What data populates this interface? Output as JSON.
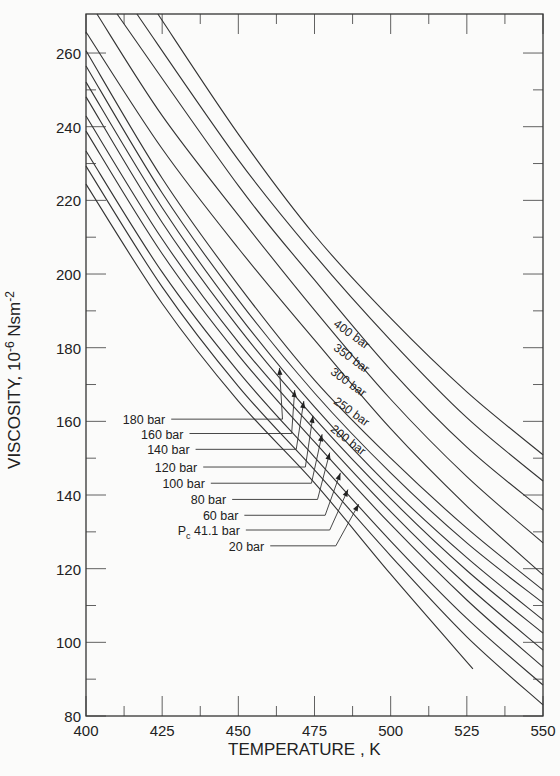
{
  "page": {
    "top_text_fragment": "—   —  ·  ·  ·    ·  ·  ·  ·  ·"
  },
  "chart_data": {
    "type": "line",
    "title": "",
    "xlabel": "TEMPERATURE , K",
    "ylabel_main": "VISCOSITY, 10",
    "ylabel_exp": "-6",
    "ylabel_unit": " Nsm",
    "ylabel_unit_exp": "-2",
    "xlim": [
      400,
      550
    ],
    "ylim": [
      80,
      270.6
    ],
    "grid": false,
    "x_ticks": [
      400,
      425,
      450,
      475,
      500,
      525,
      550
    ],
    "x_tick_labels": [
      "400",
      "425",
      "450",
      "475",
      "500",
      "525",
      "550"
    ],
    "x_minor_ticks": [
      412.5,
      437.5,
      462.5,
      487.5,
      512.5,
      537.5
    ],
    "y_ticks": [
      80,
      100,
      120,
      140,
      160,
      180,
      200,
      220,
      240,
      260
    ],
    "y_tick_labels": [
      "80",
      "100",
      "120",
      "140",
      "160",
      "180",
      "200",
      "220",
      "240",
      "260"
    ],
    "y_minor_ticks": [
      90,
      110,
      130,
      150,
      170,
      190,
      210,
      230,
      250
    ],
    "series": [
      {
        "name": "400 bar",
        "points": [
          [
            423.6,
            270.6
          ],
          [
            450,
            238
          ],
          [
            475,
            210.6
          ],
          [
            500,
            188
          ],
          [
            525,
            168
          ],
          [
            550,
            150.9
          ]
        ]
      },
      {
        "name": "350 bar",
        "points": [
          [
            416.7,
            270.6
          ],
          [
            450,
            231
          ],
          [
            475,
            205.2
          ],
          [
            500,
            182
          ],
          [
            525,
            161
          ],
          [
            550,
            143.8
          ]
        ]
      },
      {
        "name": "300 bar",
        "points": [
          [
            410.2,
            270.6
          ],
          [
            450,
            224
          ],
          [
            475,
            198.4
          ],
          [
            500,
            174
          ],
          [
            525,
            153
          ],
          [
            550,
            135.9
          ]
        ]
      },
      {
        "name": "250 bar",
        "points": [
          [
            403.6,
            270.6
          ],
          [
            425,
            243
          ],
          [
            450,
            216
          ],
          [
            475,
            190.2
          ],
          [
            500,
            166
          ],
          [
            525,
            145
          ],
          [
            550,
            127.0
          ]
        ]
      },
      {
        "name": "200 bar",
        "points": [
          [
            400,
            265.7
          ],
          [
            425,
            234
          ],
          [
            450,
            207
          ],
          [
            475,
            182.1
          ],
          [
            500,
            158
          ],
          [
            525,
            137
          ],
          [
            550,
            118.3
          ]
        ]
      },
      {
        "name": "180 bar",
        "points": [
          [
            400,
            260.6
          ],
          [
            425,
            226
          ],
          [
            450,
            197
          ],
          [
            475,
            171.2
          ],
          [
            500,
            150
          ],
          [
            525,
            131
          ],
          [
            550,
            114.2
          ]
        ]
      },
      {
        "name": "160 bar",
        "points": [
          [
            400,
            256.5
          ],
          [
            425,
            222
          ],
          [
            450,
            193
          ],
          [
            475,
            167.7
          ],
          [
            500,
            146
          ],
          [
            525,
            127
          ],
          [
            550,
            110.7
          ]
        ]
      },
      {
        "name": "140 bar",
        "points": [
          [
            400,
            252.1
          ],
          [
            425,
            218
          ],
          [
            450,
            189
          ],
          [
            475,
            163.9
          ],
          [
            500,
            142
          ],
          [
            525,
            123
          ],
          [
            550,
            106.1
          ]
        ]
      },
      {
        "name": "120 bar",
        "points": [
          [
            400,
            248.1
          ],
          [
            425,
            214
          ],
          [
            450,
            185.5
          ],
          [
            475,
            160.9
          ],
          [
            500,
            139
          ],
          [
            525,
            119.5
          ],
          [
            550,
            102.5
          ]
        ]
      },
      {
        "name": "100 bar",
        "points": [
          [
            400,
            242.9
          ],
          [
            425,
            209.5
          ],
          [
            450,
            181.5
          ],
          [
            475,
            157.7
          ],
          [
            500,
            135.5
          ],
          [
            525,
            115.5
          ],
          [
            550,
            97.9
          ]
        ]
      },
      {
        "name": "80 bar",
        "points": [
          [
            400,
            238.8
          ],
          [
            425,
            205.5
          ],
          [
            450,
            178
          ],
          [
            475,
            154.4
          ],
          [
            500,
            132
          ],
          [
            525,
            111.5
          ],
          [
            550,
            93.3
          ]
        ]
      },
      {
        "name": "60 bar",
        "points": [
          [
            400,
            233.4
          ],
          [
            425,
            200.5
          ],
          [
            450,
            173.5
          ],
          [
            475,
            150.3
          ],
          [
            500,
            127.5
          ],
          [
            525,
            106.5
          ],
          [
            550,
            88.4
          ]
        ]
      },
      {
        "name": "Pc 41.1 bar",
        "points": [
          [
            400,
            229.3
          ],
          [
            425,
            196.5
          ],
          [
            450,
            169.5
          ],
          [
            475,
            146.8
          ],
          [
            500,
            123.5
          ],
          [
            525,
            101.5
          ],
          [
            550,
            83.0
          ]
        ]
      },
      {
        "name": "20 bar",
        "points": [
          [
            400,
            224.4
          ],
          [
            425,
            192
          ],
          [
            450,
            165.5
          ],
          [
            475,
            143.3
          ],
          [
            500,
            118.5
          ],
          [
            527,
            92.8
          ]
        ]
      }
    ],
    "annotations_right": [
      {
        "text": "400 bar",
        "x": 481,
        "y": 186,
        "angle": 36
      },
      {
        "text": "350 bar",
        "x": 481,
        "y": 179.5,
        "angle": 36
      },
      {
        "text": "300 bar",
        "x": 480,
        "y": 173,
        "angle": 36
      },
      {
        "text": "250 bar",
        "x": 481,
        "y": 165,
        "angle": 36
      },
      {
        "text": "200 bar",
        "x": 480,
        "y": 157.5,
        "angle": 38
      }
    ],
    "annotations_left": [
      {
        "text": "180 bar",
        "lx": 464.5,
        "ly": 160.6,
        "ax": 463.5,
        "ay": 174.5,
        "tx": 426,
        "ty": 160.6
      },
      {
        "text": "160 bar",
        "lx": 467.5,
        "ly": 156.7,
        "ax": 468.5,
        "ay": 168.5,
        "tx": 432,
        "ty": 156.7
      },
      {
        "text": "140 bar",
        "lx": 469,
        "ly": 152.4,
        "ax": 471.5,
        "ay": 165.5,
        "tx": 434,
        "ty": 152.4
      },
      {
        "text": "120 bar",
        "lx": 472,
        "ly": 147.6,
        "ax": 474.5,
        "ay": 161.5,
        "tx": 436.5,
        "ty": 147.6
      },
      {
        "text": "100 bar",
        "lx": 474,
        "ly": 143.2,
        "ax": 477.5,
        "ay": 156.5,
        "tx": 439,
        "ty": 143.2
      },
      {
        "text": "80 bar",
        "lx": 476,
        "ly": 138.8,
        "ax": 480,
        "ay": 151.5,
        "tx": 446,
        "ty": 138.8
      },
      {
        "text": "60 bar",
        "lx": 478.5,
        "ly": 134.5,
        "ax": 483.5,
        "ay": 146,
        "tx": 450,
        "ty": 134.5
      },
      {
        "text": "41.1 bar",
        "prefix": "P",
        "prefix_sub": "c",
        "lx": 480,
        "ly": 130.5,
        "ax": 486,
        "ay": 141.5,
        "tx": 450.5,
        "ty": 130.5
      },
      {
        "text": "20 bar",
        "lx": 482,
        "ly": 126.2,
        "ax": 489.5,
        "ay": 137.5,
        "tx": 458.5,
        "ty": 126.2
      }
    ]
  }
}
